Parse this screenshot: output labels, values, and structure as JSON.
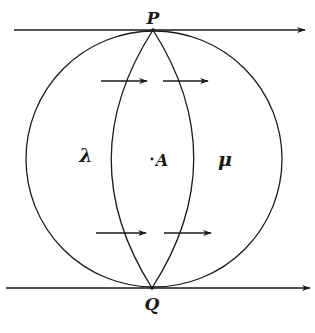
{
  "diagram": {
    "labels": {
      "top_point": "P",
      "bottom_point": "Q",
      "left_region": "λ",
      "center_point": "A",
      "right_region": "μ"
    },
    "colors": {
      "ink": "#1a1a1a",
      "background": "#ffffff"
    },
    "arrows": {
      "direction": "right",
      "count_inner": 4,
      "count_lines": 2
    }
  }
}
